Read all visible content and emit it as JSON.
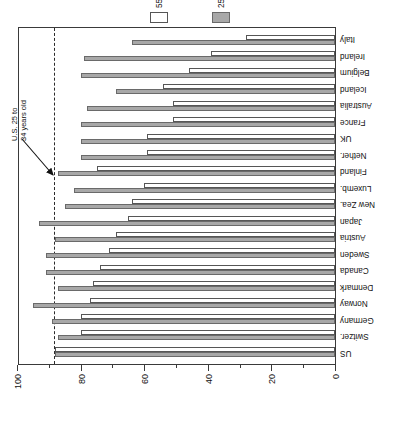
{
  "chart_data": {
    "type": "bar",
    "title": "",
    "subtitle": "",
    "xlabel": "",
    "ylabel": "Percentage of Age Group",
    "ylim": [
      0,
      100
    ],
    "grid": false,
    "orientation": "vertical-bars-rotated-90",
    "legend_position": "right",
    "categories": [
      "US",
      "Switzer.",
      "Germany",
      "Norway",
      "Denmark",
      "Canada",
      "Sweden",
      "Austria",
      "Japan",
      "New Zea.",
      "Luxemb.",
      "Finland",
      "Nether.",
      "UK",
      "France",
      "Australia",
      "Iceland",
      "Belgium",
      "Ireland",
      "Italy"
    ],
    "series": [
      {
        "name": "25 to 34 years",
        "color": "#a8a8a8",
        "values": [
          88,
          87,
          89,
          95,
          87,
          91,
          91,
          88,
          93,
          85,
          82,
          87,
          80,
          80,
          80,
          78,
          69,
          80,
          79,
          64
        ]
      },
      {
        "name": "55 to 64 years",
        "color": "#ffffff",
        "values": [
          88,
          80,
          80,
          77,
          76,
          74,
          71,
          69,
          65,
          64,
          60,
          75,
          59,
          59,
          51,
          51,
          54,
          46,
          39,
          28
        ]
      }
    ],
    "major_ticks": [
      0,
      20,
      40,
      60,
      80,
      100
    ],
    "major_tick_labels": [
      "0",
      "20",
      "40",
      "60",
      "80",
      "100"
    ],
    "minor_ticks": [
      10,
      30,
      50,
      70,
      90
    ],
    "reference_line": {
      "value": 88,
      "style": "dashed",
      "label": "U.S. 25 to\n34 years old",
      "label_line1": "U.S. 25 to",
      "label_line2": "34 years old",
      "annotation_arrow": "arrow pointing down-left to dashed line"
    }
  },
  "axis": {
    "title": "Percentage of Age Group"
  },
  "legend": {
    "entries": [
      {
        "label": "55 to 64 years",
        "swatch": "hollow-white-rect"
      },
      {
        "label": "25 to 34 years",
        "swatch": "filled-gray-rect"
      }
    ]
  }
}
